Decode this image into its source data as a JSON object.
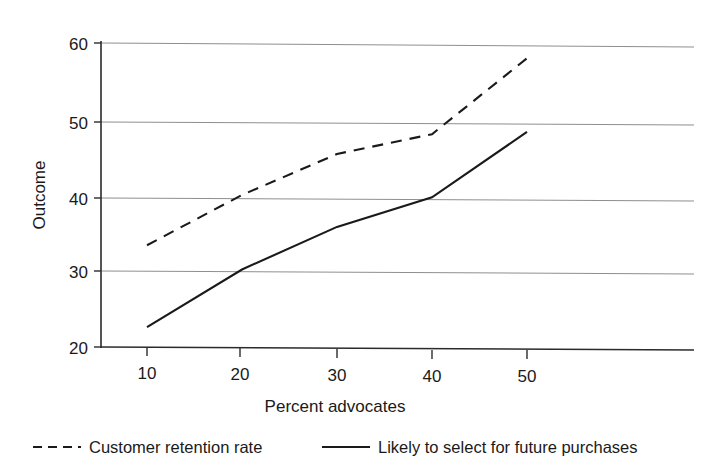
{
  "chart_data": {
    "type": "line",
    "title": "",
    "xlabel": "Percent advocates",
    "ylabel": "Outcome",
    "x": [
      10,
      20,
      30,
      40,
      50
    ],
    "xticklabels": [
      "10",
      "20",
      "30",
      "40",
      "50"
    ],
    "yticks": [
      20,
      30,
      40,
      50,
      60
    ],
    "yticklabels": [
      "20",
      "30",
      "40",
      "50",
      "60"
    ],
    "xlim": [
      5,
      55
    ],
    "ylim": [
      20,
      60
    ],
    "grid": "horizontal",
    "legend_position": "below-axes",
    "series": [
      {
        "name": "Customer retention rate",
        "style": "dashed",
        "values": [
          33.4,
          40.0,
          45.4,
          48.0,
          58.0
        ]
      },
      {
        "name": "Likely to select for future purchases",
        "style": "solid",
        "values": [
          22.6,
          30.2,
          35.8,
          39.7,
          48.3
        ]
      }
    ]
  },
  "axes": {
    "y_label": "Outcome",
    "x_label": "Percent advocates",
    "y_tick_0": "20",
    "y_tick_1": "30",
    "y_tick_2": "40",
    "y_tick_3": "50",
    "y_tick_4": "60",
    "x_tick_0": "10",
    "x_tick_1": "20",
    "x_tick_2": "30",
    "x_tick_3": "40",
    "x_tick_4": "50"
  },
  "legend": {
    "entry_0_label": "Customer retention rate",
    "entry_1_label": "Likely to select for future purchases"
  },
  "colors": {
    "line": "#1a1a1a",
    "grid": "#8f8f8f",
    "axis": "#2b2b2b",
    "background": "#ffffff"
  }
}
